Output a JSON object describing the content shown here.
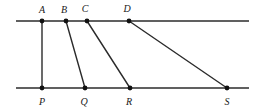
{
  "figure": {
    "canvas": {
      "width": 255,
      "height": 112,
      "background": "#ffffff"
    },
    "style": {
      "line_color": "#2b2b2b",
      "rail_stroke_width": 1.4,
      "transversal_stroke_width": 1.4,
      "dot_color": "#111111",
      "dot_radius": 2.4,
      "label_color": "#1a1a1a",
      "label_font_size": 10
    },
    "rails": [
      {
        "name": "upper-parallel-line",
        "x1": 16,
        "y1": 21,
        "x2": 249,
        "y2": 21
      },
      {
        "name": "lower-parallel-line",
        "x1": 16,
        "y1": 88,
        "x2": 249,
        "y2": 88
      }
    ],
    "points": [
      {
        "id": "A",
        "label": "A",
        "x": 42,
        "y": 21,
        "label_x": 42,
        "label_y": 13,
        "on": "upper-parallel-line"
      },
      {
        "id": "B",
        "label": "B",
        "x": 66,
        "y": 21,
        "label_x": 64,
        "label_y": 13,
        "on": "upper-parallel-line"
      },
      {
        "id": "C",
        "label": "C",
        "x": 87,
        "y": 21,
        "label_x": 85,
        "label_y": 12,
        "on": "upper-parallel-line"
      },
      {
        "id": "D",
        "label": "D",
        "x": 129,
        "y": 21,
        "label_x": 127,
        "label_y": 12,
        "on": "upper-parallel-line"
      },
      {
        "id": "P",
        "label": "P",
        "x": 42,
        "y": 88,
        "label_x": 42,
        "label_y": 105,
        "on": "lower-parallel-line"
      },
      {
        "id": "Q",
        "label": "Q",
        "x": 85,
        "y": 88,
        "label_x": 84,
        "label_y": 105,
        "on": "lower-parallel-line"
      },
      {
        "id": "R",
        "label": "R",
        "x": 130,
        "y": 88,
        "label_x": 129,
        "label_y": 105,
        "on": "lower-parallel-line"
      },
      {
        "id": "S",
        "label": "S",
        "x": 227,
        "y": 88,
        "label_x": 227,
        "label_y": 105,
        "on": "lower-parallel-line"
      }
    ],
    "segments": [
      {
        "name": "segment-AP",
        "from": "A",
        "to": "P",
        "x1": 42,
        "y1": 21,
        "x2": 42,
        "y2": 88
      },
      {
        "name": "segment-BQ",
        "from": "B",
        "to": "Q",
        "x1": 66,
        "y1": 21,
        "x2": 85,
        "y2": 88
      },
      {
        "name": "segment-CR",
        "from": "C",
        "to": "R",
        "x1": 87,
        "y1": 21,
        "x2": 130,
        "y2": 88
      },
      {
        "name": "segment-DS",
        "from": "D",
        "to": "S",
        "x1": 129,
        "y1": 21,
        "x2": 227,
        "y2": 88
      }
    ]
  }
}
